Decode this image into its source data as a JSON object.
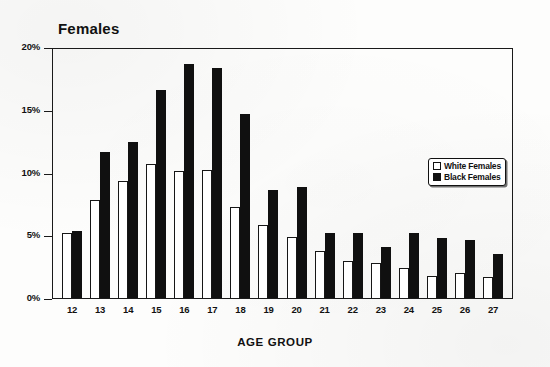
{
  "chart_data": {
    "type": "bar",
    "title": "Females",
    "xlabel": "AGE GROUP",
    "ylabel": "",
    "categories": [
      "12",
      "13",
      "14",
      "15",
      "16",
      "17",
      "18",
      "19",
      "20",
      "21",
      "22",
      "23",
      "24",
      "25",
      "26",
      "27"
    ],
    "series": [
      {
        "name": "White Females",
        "color": "#ffffff",
        "values": [
          5.2,
          7.9,
          9.4,
          10.8,
          10.2,
          10.3,
          7.3,
          5.9,
          4.9,
          3.8,
          3.0,
          2.8,
          2.4,
          1.8,
          2.0,
          1.7
        ]
      },
      {
        "name": "Black Females",
        "color": "#101010",
        "values": [
          5.4,
          11.7,
          12.5,
          16.7,
          18.8,
          18.5,
          14.8,
          8.7,
          8.9,
          5.2,
          5.2,
          4.1,
          5.2,
          4.8,
          4.7,
          3.5
        ]
      }
    ],
    "ylim": [
      0,
      20
    ],
    "ytick_values": [
      0,
      5,
      10,
      15,
      20
    ],
    "ytick_labels": [
      "0%",
      "5%",
      "10%",
      "15%",
      "20%"
    ],
    "grid": false,
    "legend_position": "right-inside",
    "legend_entries": [
      "White Females",
      "Black Females"
    ]
  },
  "legend": {
    "white_label": "White Females",
    "black_label": "Black Females"
  }
}
